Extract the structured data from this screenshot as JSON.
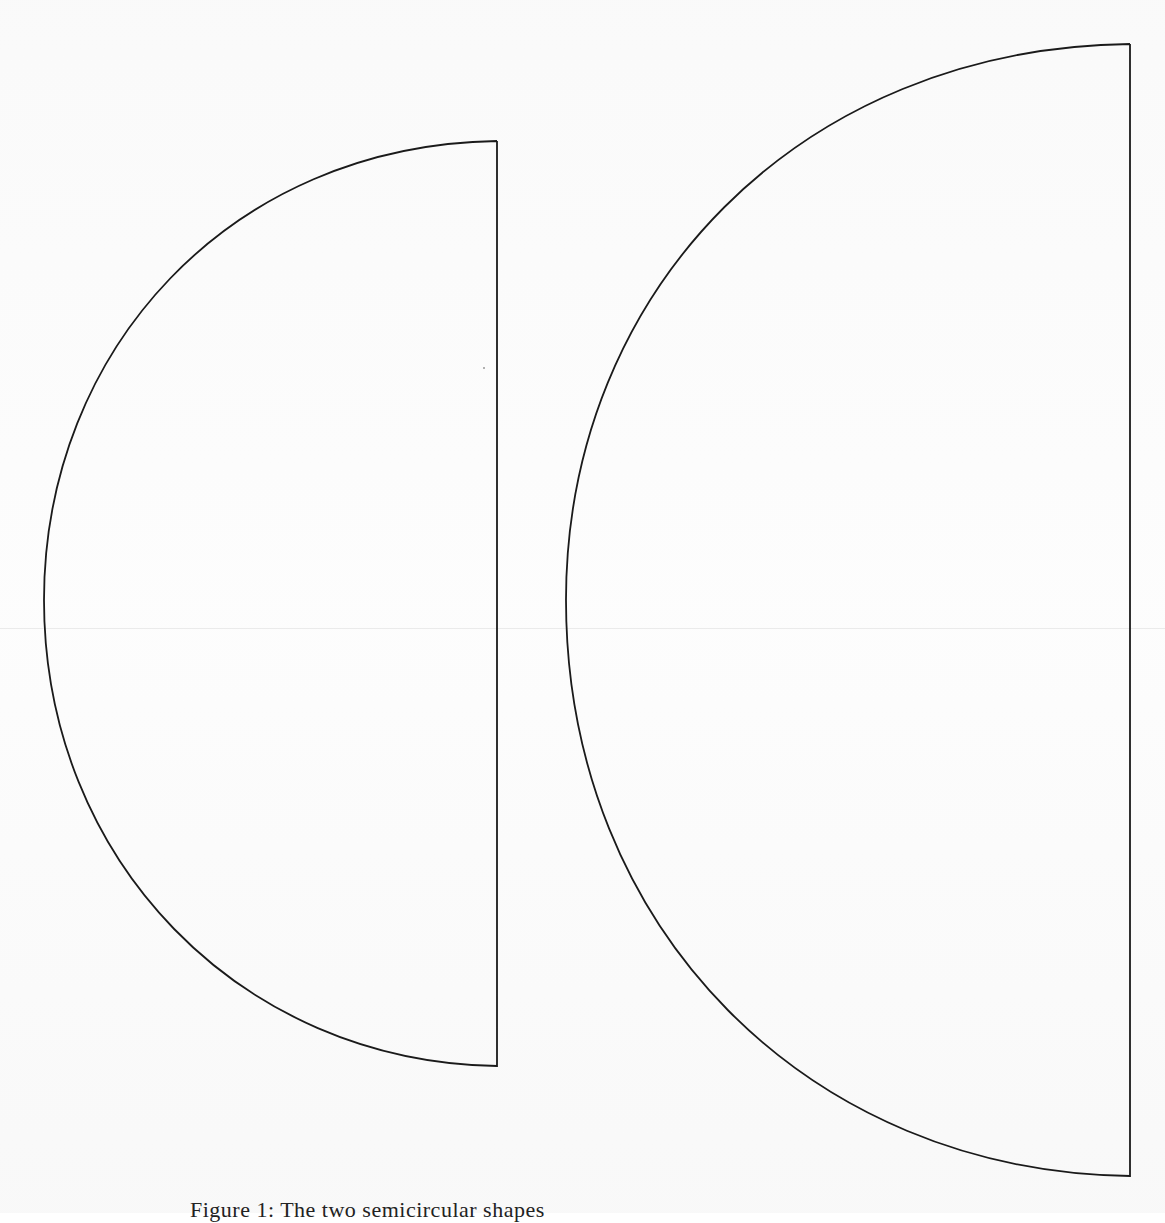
{
  "figure": {
    "caption": "Figure 1: The two semicircular shapes",
    "shapes": [
      {
        "name": "small-semicircle",
        "top": [
          497,
          141
        ],
        "bottom": [
          497,
          1066
        ],
        "leftmost": [
          44,
          600
        ],
        "stroke": "#1a1a1a"
      },
      {
        "name": "large-semicircle",
        "top": [
          1130,
          44
        ],
        "bottom": [
          1130,
          1176
        ],
        "leftmost": [
          566,
          600
        ],
        "stroke": "#1a1a1a"
      }
    ]
  }
}
